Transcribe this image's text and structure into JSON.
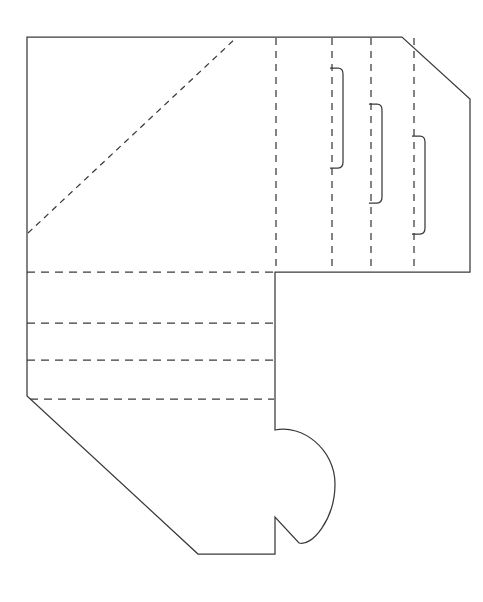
{
  "document": {
    "title": "Box Dieline Template",
    "kind": "packaging-dieline",
    "description": "Flat cut-and-fold template for a folded paper box / envelope-style carton",
    "canvas": {
      "width": 483,
      "height": 602,
      "background": "#ffffff"
    }
  },
  "style": {
    "cut_line_color": "#3a3a3a",
    "fold_line_color": "#3a3a3a",
    "cut_line_width": 1.25,
    "fold_line_width": 1.25,
    "fold_dash_pattern": "7,5",
    "fold_dash_pattern_fine": "5,4",
    "fill_color": "#ffffff"
  },
  "legend": {
    "cut_label": "cut line (solid)",
    "fold_label": "fold line (dashed)"
  },
  "geometry": {
    "outline_path": "M 27,37 L 402,37 L 470,99 L 470,272 L 275,272 L 275,430 C 300,424 335,447 335,483 C 335,520 311,546 299,543 L 275,517 L 275,554 L 198,554 L 28,396 L 27,396 Z",
    "outline_points": [
      {
        "name": "top-left-corner",
        "x": 27,
        "y": 37
      },
      {
        "name": "top-right-bevel-start",
        "x": 402,
        "y": 37
      },
      {
        "name": "top-right-bevel-end",
        "x": 470,
        "y": 99
      },
      {
        "name": "right-bottom-corner",
        "x": 470,
        "y": 272
      },
      {
        "name": "mid-step-corner",
        "x": 275,
        "y": 272
      },
      {
        "name": "tongue-top",
        "x": 275,
        "y": 430
      },
      {
        "name": "tongue-notch-inner",
        "x": 299,
        "y": 543
      },
      {
        "name": "tongue-notch-up",
        "x": 275,
        "y": 517
      },
      {
        "name": "bottom-right-corner",
        "x": 275,
        "y": 554
      },
      {
        "name": "bottom-left-corner",
        "x": 198,
        "y": 554
      },
      {
        "name": "left-diagonal-top",
        "x": 28,
        "y": 396
      }
    ],
    "fold_lines": [
      {
        "name": "diagonal-fold-top-left",
        "type": "line",
        "x1": 28,
        "y1": 233,
        "x2": 236,
        "y2": 38
      },
      {
        "name": "vertical-fold-1",
        "type": "line",
        "x1": 276,
        "y1": 37,
        "x2": 276,
        "y2": 272
      },
      {
        "name": "vertical-fold-2",
        "type": "line",
        "x1": 332,
        "y1": 37,
        "x2": 332,
        "y2": 272
      },
      {
        "name": "vertical-fold-3",
        "type": "line",
        "x1": 371,
        "y1": 37,
        "x2": 371,
        "y2": 272
      },
      {
        "name": "vertical-fold-4",
        "type": "line",
        "x1": 414,
        "y1": 37,
        "x2": 414,
        "y2": 272
      },
      {
        "name": "horizontal-fold-1",
        "type": "line",
        "x1": 27,
        "y1": 272,
        "x2": 276,
        "y2": 272
      },
      {
        "name": "horizontal-fold-2",
        "type": "line",
        "x1": 27,
        "y1": 323,
        "x2": 275,
        "y2": 323
      },
      {
        "name": "horizontal-fold-3",
        "type": "line",
        "x1": 27,
        "y1": 360,
        "x2": 275,
        "y2": 360
      },
      {
        "name": "horizontal-fold-4",
        "type": "line",
        "x1": 30,
        "y1": 399,
        "x2": 275,
        "y2": 399
      }
    ],
    "slit_tabs": [
      {
        "name": "slit-tab-1",
        "path": "M 331,68 L 338,68 Q 343,68 343,74 L 343,162 Q 343,168 338,168 L 331,168",
        "top": 68,
        "bottom": 168,
        "left": 331,
        "right": 343
      },
      {
        "name": "slit-tab-2",
        "path": "M 370,104 L 377,104 Q 382,104 382,110 L 382,197 Q 382,203 377,203 L 370,203",
        "top": 104,
        "bottom": 203,
        "left": 370,
        "right": 382
      },
      {
        "name": "slit-tab-3",
        "path": "M 413,136 L 420,136 Q 425,136 425,142 L 425,228 Q 425,234 420,234 L 413,234",
        "top": 136,
        "bottom": 234,
        "left": 413,
        "right": 425
      }
    ],
    "tongue_curve": {
      "name": "rounded-closure-tongue",
      "path": "M 275,430 C 302,424 335,449 335,484 C 335,519 312,547 299,543 L 275,517"
    }
  },
  "panels": [
    {
      "name": "main-body-panel",
      "label": ""
    },
    {
      "name": "right-flap-panel",
      "label": ""
    },
    {
      "name": "lower-fold-panel",
      "label": ""
    },
    {
      "name": "closure-tongue-panel",
      "label": ""
    }
  ]
}
